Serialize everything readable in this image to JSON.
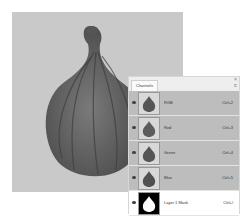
{
  "document": {
    "subject": "fig",
    "canvas_bg": "#c9c9c9",
    "fig_color": "#6d6d6d"
  },
  "panel": {
    "tab_label": "Channels",
    "close_icon": "×",
    "menu_icon": "≡",
    "channels": [
      {
        "name": "RGB",
        "shortcut": "Ctrl+2",
        "selected": true,
        "thumb": "fig-gray"
      },
      {
        "name": "Red",
        "shortcut": "Ctrl+3",
        "selected": true,
        "thumb": "fig-gray"
      },
      {
        "name": "Green",
        "shortcut": "Ctrl+4",
        "selected": true,
        "thumb": "fig-gray"
      },
      {
        "name": "Blue",
        "shortcut": "Ctrl+5",
        "selected": true,
        "thumb": "fig-gray"
      },
      {
        "name": "Layer 1 Mask",
        "shortcut": "Ctrl+\\",
        "selected": false,
        "thumb": "mask"
      }
    ]
  }
}
